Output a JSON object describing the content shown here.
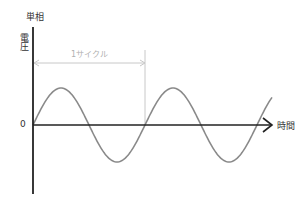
{
  "diagram": {
    "title": "単相",
    "y_axis_label": "電圧",
    "x_axis_label": "時間",
    "origin_label": "0",
    "cycle_label": "1サイクル"
  },
  "colors": {
    "axis": "#222222",
    "wave": "#8a8a8a",
    "cycle_marker": "#c8c8c8",
    "text": "#333333"
  },
  "geometry": {
    "origin": [
      33,
      125
    ],
    "period_px": 112,
    "amplitude_px": 37,
    "x_end": 272
  }
}
